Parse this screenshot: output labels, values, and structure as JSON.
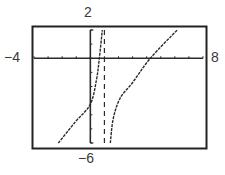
{
  "chart_data": {
    "type": "line",
    "title": "",
    "xlabel": "",
    "ylabel": "",
    "xlim": [
      -4,
      8
    ],
    "ylim": [
      -6,
      2
    ],
    "x_scale_ticks": 1,
    "y_scale_ticks": 1,
    "grid": false,
    "window_labels": {
      "xmin": "-4",
      "xmax": "8",
      "ymax": "2",
      "ymin": "-6"
    },
    "asymptotes": [
      {
        "type": "vertical",
        "x": 1,
        "style": "dashed"
      }
    ],
    "series": [
      {
        "name": "left branch",
        "points": [
          [
            -2.27,
            -6
          ],
          [
            -1.06,
            -4.5
          ],
          [
            0,
            -3.25
          ],
          [
            0.43,
            -1.55
          ],
          [
            0.64,
            0
          ],
          [
            0.85,
            2
          ]
        ]
      },
      {
        "name": "right branch",
        "points": [
          [
            1.42,
            -6
          ],
          [
            1.63,
            -4.25
          ],
          [
            2.13,
            -2.8
          ],
          [
            2.98,
            -1.75
          ],
          [
            4.26,
            0
          ],
          [
            6.17,
            2
          ]
        ]
      }
    ]
  },
  "labels": {
    "xmin": "−4",
    "xmax": "8",
    "ymax": "2",
    "ymin": "−6"
  },
  "colors": {
    "ink": "#2b2b2b",
    "frame": "#222222",
    "background": "#ffffff"
  }
}
